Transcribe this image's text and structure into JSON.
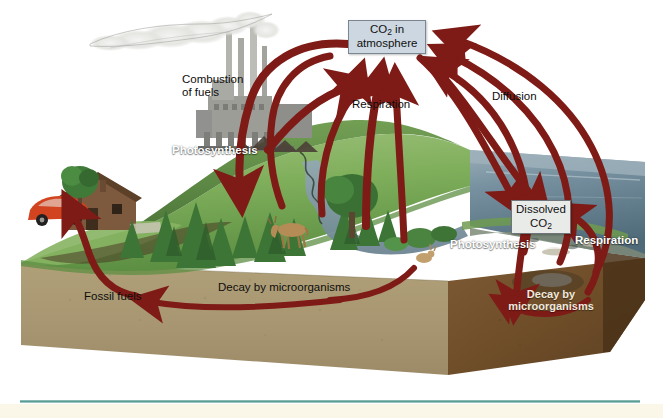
{
  "figure": {
    "type": "illustrated-diagram"
  },
  "boxes": {
    "atmosphere": {
      "line1": "CO",
      "sub1": "2",
      "line1b": " in",
      "line2": "atmosphere",
      "fill": "#ccd7e1"
    },
    "dissolved": {
      "line1": "Dissolved",
      "line2": "CO",
      "sub2": "2",
      "fill": "#e9ebe9"
    }
  },
  "labels": {
    "combustion": "Combustion\nof fuels",
    "photosynthesis_land": "Photosynthesis",
    "respiration_land": "Respiration",
    "diffusion": "Diffusion",
    "photosynthesis_ocean": "Photosynthesis",
    "respiration_ocean": "Respiration",
    "fossil_fuels": "Fossil fuels",
    "decay_land": "Decay by microorganisms",
    "decay_ocean": "Decay by\nmicroorganisms"
  },
  "colors": {
    "arrow": "#7e1b16",
    "grass": "#7eae5a",
    "grass_dark": "#4e7a38",
    "soil": "#a89770",
    "soil_dark": "#8d7c58",
    "seafloor": "#6d4a28",
    "water": "#6f8697",
    "water_deep": "#56707f",
    "water_far": "#8ba0ac",
    "box_atmos": "#ccd7e1",
    "box_dissolved": "#e9ebe9",
    "smoke": "#e8e8e6",
    "factory": "#9a9a96",
    "house_roof": "#6b4a33",
    "car": "#d1441f",
    "tree_green": "#3f7a38",
    "deer": "#b58c55",
    "rule": "#5a9c96",
    "footer_band": "#fbf7e8",
    "background": "#ffffff"
  },
  "flows": [
    {
      "name": "combustion-to-atmosphere",
      "from": "factory",
      "to": "atmosphere"
    },
    {
      "name": "photosynthesis-uptake",
      "from": "atmosphere",
      "to": "land-plants"
    },
    {
      "name": "respiration-to-atmosphere",
      "from": "land-biota",
      "to": "atmosphere"
    },
    {
      "name": "diffusion-ocean-air",
      "from": "ocean",
      "to": "atmosphere"
    },
    {
      "name": "dissolved-co2-input",
      "from": "atmosphere",
      "to": "dissolved"
    },
    {
      "name": "ocean-respiration",
      "from": "marine-biota",
      "to": "dissolved"
    },
    {
      "name": "decay-land-to-fossil",
      "from": "land-decay",
      "to": "fossil-fuels"
    },
    {
      "name": "decay-ocean",
      "from": "marine-decay",
      "to": "seafloor"
    }
  ]
}
